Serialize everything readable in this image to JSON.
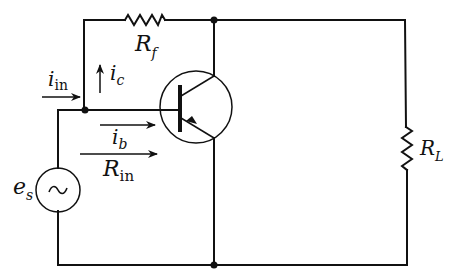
{
  "diagram": {
    "type": "circuit-schematic",
    "components": {
      "feedback_resistor": {
        "symbol": "R",
        "subscript": "f"
      },
      "load_resistor": {
        "symbol": "R",
        "subscript": "L"
      },
      "source": {
        "symbol": "e",
        "subscript": "s",
        "glyph": "~"
      },
      "transistor": {
        "kind": "PNP BJT"
      }
    },
    "currents": {
      "input": {
        "symbol": "i",
        "subscript": "in"
      },
      "collector_feedback": {
        "symbol": "i",
        "subscript": "c"
      },
      "base": {
        "symbol": "i",
        "subscript": "b"
      }
    },
    "impedances": {
      "input_resistance": {
        "symbol": "R",
        "subscript": "in"
      }
    },
    "colors": {
      "ink": "#111111",
      "background": "#ffffff"
    }
  }
}
